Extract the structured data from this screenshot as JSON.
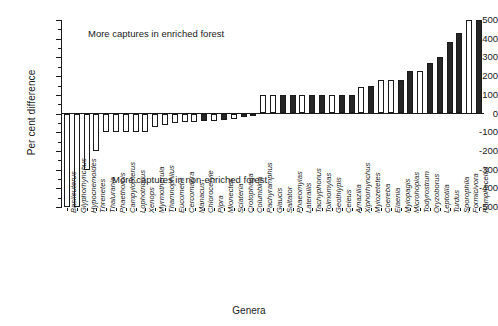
{
  "chart_data": {
    "type": "bar",
    "title": "",
    "xlabel": "Genera",
    "ylabel": "Per cent difference",
    "ylim": [
      -500,
      500
    ],
    "ytick_labels": [
      "500",
      "400",
      "300",
      "200",
      "100",
      "0",
      "-100",
      "-200",
      "-300",
      "-400",
      "-500"
    ],
    "ytick_values": [
      500,
      400,
      300,
      200,
      100,
      0,
      -100,
      -200,
      -300,
      -400,
      -500
    ],
    "grid": false,
    "legend": null,
    "annotations": [
      {
        "text": "More captures in enriched forest",
        "value": 400
      },
      {
        "text": "More captures in non-enriched forest",
        "value": -300
      }
    ],
    "categories": [
      "Basileuterus",
      "Glyphorhynchus",
      "Hypocnemoides",
      "Threnetes",
      "Thalurania",
      "Phaethornis",
      "Campylopterus",
      "Lophotriccus",
      "Xenops",
      "Myrmotherula",
      "Thamnophilus",
      "Eucometis",
      "Cercomacra",
      "Manacus",
      "Chloroceryle",
      "Pipra",
      "Mionectes",
      "Sclateria",
      "Crotophaga",
      "Columbina",
      "Pachyramphus",
      "Glaucis",
      "Saltator",
      "Phaeomyias",
      "Laterallis",
      "Tachyphonus",
      "Tolmomyias",
      "Geothlypis",
      "Celeus",
      "Amazilia",
      "Xiphorhynchus",
      "Myiozetetes",
      "Coereba",
      "Elaenia",
      "Myiopagis",
      "Microhopias",
      "Todyrostrum",
      "Oryzoborus",
      "Leptotila",
      "Turdus",
      "Sporophila",
      "Formicivora",
      "Ramphocelus"
    ],
    "values": [
      -500,
      -500,
      -300,
      -200,
      -100,
      -100,
      -100,
      -100,
      -100,
      -70,
      -60,
      -50,
      -45,
      -45,
      -40,
      -40,
      -35,
      -30,
      -20,
      -10,
      100,
      100,
      100,
      100,
      100,
      100,
      100,
      100,
      100,
      100,
      140,
      150,
      180,
      180,
      180,
      230,
      230,
      270,
      300,
      380,
      430,
      500,
      500
    ],
    "fills": [
      "white",
      "white",
      "white",
      "white",
      "white",
      "white",
      "white",
      "white",
      "white",
      "white",
      "white",
      "white",
      "white",
      "white",
      "black",
      "white",
      "black",
      "white",
      "black",
      "black",
      "white",
      "white",
      "black",
      "black",
      "white",
      "black",
      "black",
      "white",
      "black",
      "black",
      "white",
      "black",
      "white",
      "white",
      "black",
      "black",
      "white",
      "black",
      "black",
      "black",
      "black",
      "white",
      "black"
    ]
  }
}
